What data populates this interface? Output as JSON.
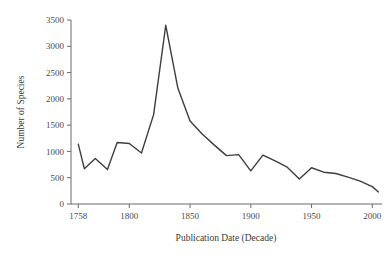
{
  "chart_data": {
    "type": "line",
    "title": "",
    "subtitle": "",
    "xlabel": "Publication Date (Decade)",
    "ylabel": "Number of Species",
    "xlim": [
      1752,
      2008
    ],
    "ylim": [
      0,
      3500
    ],
    "grid": false,
    "legend": null,
    "xticks": [
      1758,
      1800,
      1850,
      1900,
      1950,
      2000
    ],
    "xticklabels": [
      "1758",
      "1800",
      "1850",
      "1900",
      "1950",
      "2000"
    ],
    "yticks": [
      0,
      500,
      1000,
      1500,
      2000,
      2500,
      3000,
      3500
    ],
    "yticklabels": [
      "0",
      "500",
      "1000",
      "1500",
      "2000",
      "2500",
      "3000",
      "3500"
    ],
    "line_color": "#3d3d3d",
    "axis_color": "#6b6b6b",
    "background_color": "#ffffff",
    "x": [
      1758,
      1763,
      1772,
      1782,
      1790,
      1800,
      1810,
      1820,
      1830,
      1840,
      1850,
      1860,
      1870,
      1880,
      1890,
      1900,
      1910,
      1920,
      1930,
      1940,
      1950,
      1960,
      1970,
      1980,
      1990,
      2000,
      2005
    ],
    "values": [
      1140,
      670,
      865,
      655,
      1170,
      1150,
      970,
      1700,
      3400,
      2200,
      1580,
      1330,
      1120,
      920,
      940,
      630,
      930,
      820,
      700,
      475,
      690,
      605,
      580,
      510,
      435,
      330,
      230
    ],
    "series": [
      {
        "name": "Number of Species",
        "values": [
          1140,
          670,
          865,
          655,
          1170,
          1150,
          970,
          1700,
          3400,
          2200,
          1580,
          1330,
          1120,
          920,
          940,
          630,
          930,
          820,
          700,
          475,
          690,
          605,
          580,
          510,
          435,
          330,
          230
        ]
      }
    ],
    "annotations": []
  },
  "axes": {
    "x_title": "Publication Date (Decade)",
    "y_title": "Number of Species"
  }
}
